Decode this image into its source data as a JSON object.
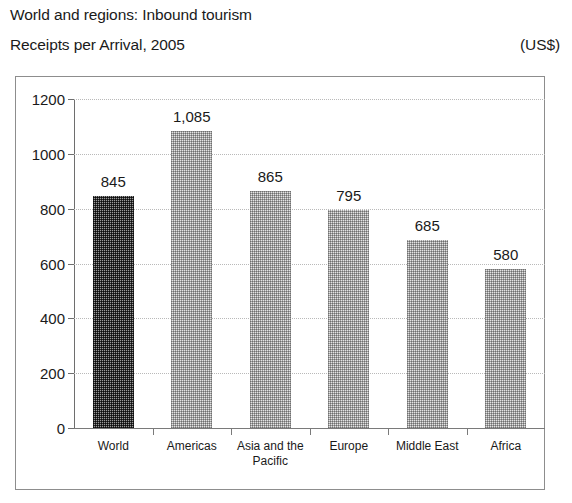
{
  "header": {
    "title_line1": "World and regions: Inbound tourism",
    "title_line2": "Receipts per Arrival, 2005",
    "units": "(US$)"
  },
  "chart_data": {
    "type": "bar",
    "title": "World and regions: Inbound tourism Receipts per Arrival, 2005",
    "subtitle": "Receipts per Arrival, 2005",
    "units": "(US$)",
    "xlabel": "",
    "ylabel": "",
    "ylim": [
      0,
      1200
    ],
    "yticks": [
      0,
      200,
      400,
      600,
      800,
      1000,
      1200
    ],
    "ytick_labels": [
      "0",
      "200",
      "400",
      "600",
      "800",
      "1000",
      "1200"
    ],
    "grid": true,
    "legend": false,
    "categories": [
      "World",
      "Americas",
      "Asia and the\nPacific",
      "Europe",
      "Middle East",
      "Africa"
    ],
    "values": [
      845,
      1085,
      865,
      795,
      685,
      580
    ],
    "value_labels": [
      "845",
      "1,085",
      "865",
      "795",
      "685",
      "580"
    ],
    "bar_shades": [
      "dark",
      "light",
      "light",
      "light",
      "light",
      "light"
    ],
    "colors": {
      "bar_dark": "#6e6e6e",
      "bar_light": "#d9d9d9",
      "axis": "#6e6e6e",
      "grid": "#b9b9b9",
      "frame": "#8d8d8d",
      "text": "#1a1a1a"
    }
  }
}
